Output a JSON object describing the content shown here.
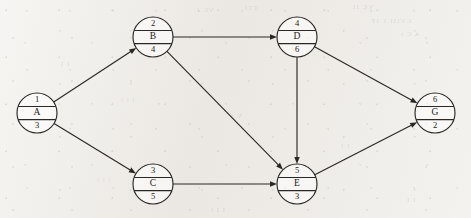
{
  "diagram": {
    "type": "activity-on-node-network",
    "nodes": [
      {
        "id": "A",
        "number": "1",
        "label": "A",
        "duration": "3",
        "cx": 37,
        "cy": 113,
        "r": 20
      },
      {
        "id": "B",
        "number": "2",
        "label": "B",
        "duration": "4",
        "cx": 153,
        "cy": 37,
        "r": 20
      },
      {
        "id": "C",
        "number": "3",
        "label": "C",
        "duration": "5",
        "cx": 153,
        "cy": 184,
        "r": 20
      },
      {
        "id": "D",
        "number": "4",
        "label": "D",
        "duration": "6",
        "cx": 297,
        "cy": 37,
        "r": 20
      },
      {
        "id": "E",
        "number": "5",
        "label": "E",
        "duration": "3",
        "cx": 297,
        "cy": 184,
        "r": 20
      },
      {
        "id": "G",
        "number": "6",
        "label": "G",
        "duration": "2",
        "cx": 435,
        "cy": 113,
        "r": 20
      }
    ],
    "edges": [
      {
        "from": "A",
        "to": "B",
        "directed": true
      },
      {
        "from": "A",
        "to": "C",
        "directed": true
      },
      {
        "from": "B",
        "to": "D",
        "directed": true
      },
      {
        "from": "B",
        "to": "E",
        "directed": true
      },
      {
        "from": "C",
        "to": "E",
        "directed": true
      },
      {
        "from": "D",
        "to": "E",
        "directed": true
      },
      {
        "from": "D",
        "to": "G",
        "directed": true
      },
      {
        "from": "E",
        "to": "G",
        "directed": true
      }
    ],
    "background": {
      "paper_color": "#ece9e4",
      "ink_color": "#2b2824",
      "ghost_marks": [
        {
          "text": "VC I",
          "x": 196,
          "y": 6
        },
        {
          "text": "TTI",
          "x": 244,
          "y": 4
        },
        {
          "text": "VC II",
          "x": 352,
          "y": 3
        },
        {
          "text": "CVIII 1 1F",
          "x": 370,
          "y": 17
        },
        {
          "text": "A C t",
          "x": 400,
          "y": 30
        },
        {
          "text": "I I",
          "x": 60,
          "y": 60
        },
        {
          "text": "l l l",
          "x": 120,
          "y": 96
        },
        {
          "text": "V I",
          "x": 230,
          "y": 112
        },
        {
          "text": "I I",
          "x": 340,
          "y": 142
        },
        {
          "text": "t i l",
          "x": 96,
          "y": 176
        },
        {
          "text": "I I l",
          "x": 210,
          "y": 206
        },
        {
          "text": "I I",
          "x": 406,
          "y": 196
        }
      ]
    }
  }
}
